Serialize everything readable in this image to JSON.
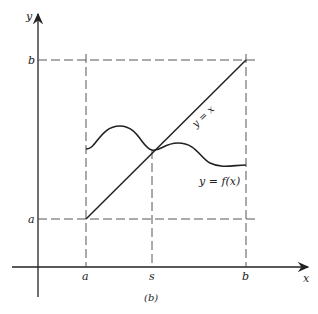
{
  "figure": {
    "caption": "(b)",
    "axes": {
      "x_label": "x",
      "y_label": "y"
    },
    "x_ticks": [
      {
        "label": "a"
      },
      {
        "label": "s"
      },
      {
        "label": "b"
      }
    ],
    "y_ticks": [
      {
        "label": "b"
      },
      {
        "label": "a"
      }
    ],
    "curves": {
      "identity_label": "y = x",
      "function_label": "y = f(x)"
    },
    "colors": {
      "ink": "#222222",
      "background": "#ffffff"
    }
  }
}
